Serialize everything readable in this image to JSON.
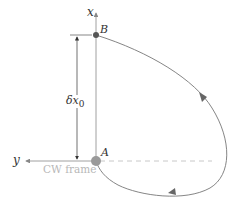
{
  "diagram": {
    "axes": {
      "x_label": "x",
      "y_label": "y",
      "frame_label": "CW frame"
    },
    "points": {
      "A": {
        "label": "A"
      },
      "B": {
        "label": "B"
      }
    },
    "dimension": {
      "label_main": "δx",
      "label_sub": "0"
    },
    "colors": {
      "axis": "#888888",
      "curve": "#777777",
      "point_A": "#9a9a9a",
      "point_B": "#555555",
      "dashed": "#c8c8c8",
      "frame_text": "#b8b8b8",
      "dimension": "#333333"
    }
  }
}
